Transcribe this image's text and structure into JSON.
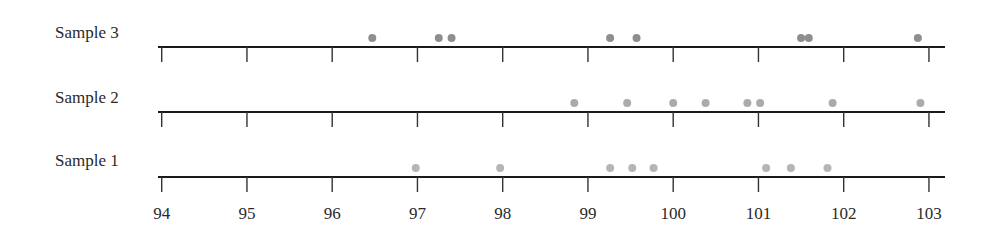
{
  "chart_data": {
    "type": "scatter",
    "subtype": "dot-plot",
    "title": "",
    "xlabel": "",
    "ylabel": "",
    "xlim": [
      94,
      103
    ],
    "x_ticks": [
      94,
      95,
      96,
      97,
      98,
      99,
      100,
      101,
      102,
      103
    ],
    "grid": false,
    "legend": "none",
    "series": [
      {
        "name": "Sample 3",
        "color": "#8e8e8e",
        "values": [
          96.47,
          97.25,
          97.4,
          99.26,
          99.57,
          101.5,
          101.59,
          102.87
        ]
      },
      {
        "name": "Sample 2",
        "color": "#ababab",
        "values": [
          98.84,
          99.46,
          100.0,
          100.38,
          100.87,
          101.02,
          101.87,
          102.9
        ]
      },
      {
        "name": "Sample 1",
        "color": "#b5b5b5",
        "values": [
          96.98,
          97.97,
          99.26,
          99.52,
          99.77,
          101.09,
          101.38,
          101.81
        ]
      }
    ]
  }
}
